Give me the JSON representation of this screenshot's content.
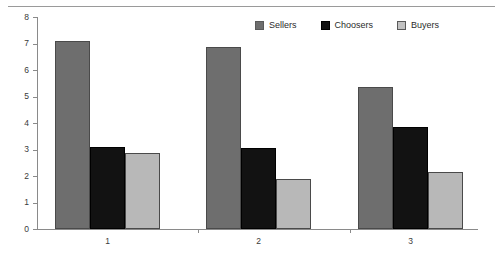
{
  "chart_data": {
    "type": "bar",
    "title": "",
    "subtitle": "",
    "xlabel": "",
    "ylabel": "",
    "categories": [
      "1",
      "2",
      "3"
    ],
    "series": [
      {
        "name": "Sellers",
        "color": "#6e6e6e",
        "values": [
          7.1,
          6.85,
          5.35
        ]
      },
      {
        "name": "Choosers",
        "color": "#121212",
        "values": [
          3.1,
          3.05,
          3.85
        ]
      },
      {
        "name": "Buyers",
        "color": "#b8b8b8",
        "values": [
          2.85,
          1.9,
          2.15
        ]
      }
    ],
    "ylim": [
      0,
      8
    ],
    "ytick_labels": [
      "8",
      "7",
      "6",
      "5",
      "4",
      "3",
      "2",
      "1",
      "0"
    ],
    "ytick_values": [
      8,
      7,
      6,
      5,
      4,
      3,
      2,
      1,
      0
    ],
    "grid": false,
    "legend_position": "top-right",
    "annotations": []
  },
  "legend": {
    "items": [
      {
        "label": "Sellers",
        "swatch": "sellers-swatch-icon"
      },
      {
        "label": "Choosers",
        "swatch": "choosers-swatch-icon"
      },
      {
        "label": "Buyers",
        "swatch": "buyers-swatch-icon"
      }
    ]
  },
  "colors": {
    "sellers": "#6e6e6e",
    "choosers": "#121212",
    "buyers": "#b8b8b8",
    "axis": "#8a8a8a",
    "rule": "#9a9a9a",
    "text": "#2b2b2b"
  }
}
